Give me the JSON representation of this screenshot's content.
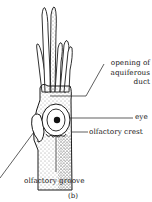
{
  "figure": {
    "caption": "(b)",
    "labels": {
      "opening_line1": "opening of",
      "opening_line2": "aquiferous",
      "opening_line3": "duct",
      "eye": "eye",
      "olfactory_crest": "olfactory crest",
      "olfactory_groove": "olfactory groove"
    },
    "colors": {
      "ink": "#1a1a1a",
      "background": "#ffffff"
    }
  }
}
